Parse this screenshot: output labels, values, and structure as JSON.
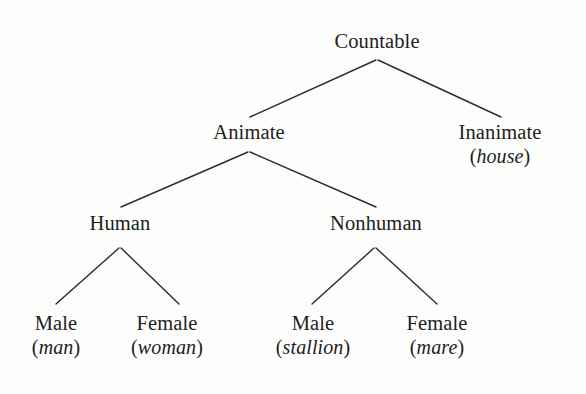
{
  "figure": {
    "kind": "tree-diagram",
    "background_color": "#fdfdfb",
    "line_color": "#2b2b2b",
    "text_color": "#201e1e"
  },
  "nodes": [
    {
      "id": "countable",
      "label": "Countable",
      "example": "",
      "paren_open": "",
      "paren_close": "",
      "x": 377,
      "y": 30,
      "level": 0
    },
    {
      "id": "animate",
      "label": "Animate",
      "example": "",
      "paren_open": "",
      "paren_close": "",
      "x": 249,
      "y": 121,
      "level": 1
    },
    {
      "id": "inanimate",
      "label": "Inanimate",
      "example": "house",
      "paren_open": "(",
      "paren_close": ")",
      "x": 500,
      "y": 121,
      "level": 1
    },
    {
      "id": "human",
      "label": "Human",
      "example": "",
      "paren_open": "",
      "paren_close": "",
      "x": 120,
      "y": 212,
      "level": 2
    },
    {
      "id": "nonhuman",
      "label": "Nonhuman",
      "example": "",
      "paren_open": "",
      "paren_close": "",
      "x": 376,
      "y": 212,
      "level": 2
    },
    {
      "id": "human-male",
      "label": "Male",
      "example": "man",
      "paren_open": "(",
      "paren_close": ")",
      "x": 56,
      "y": 312,
      "level": 3
    },
    {
      "id": "human-female",
      "label": "Female",
      "example": "woman",
      "paren_open": "(",
      "paren_close": ")",
      "x": 167,
      "y": 312,
      "level": 3
    },
    {
      "id": "nonhuman-male",
      "label": "Male",
      "example": "stallion",
      "paren_open": "(",
      "paren_close": ")",
      "x": 313,
      "y": 312,
      "level": 3
    },
    {
      "id": "nonhuman-female",
      "label": "Female",
      "example": "mare",
      "paren_open": "(",
      "paren_close": ")",
      "x": 437,
      "y": 312,
      "level": 3
    }
  ],
  "edges": [
    {
      "id": "countable-animate",
      "from": "countable",
      "to": "animate",
      "x1": 376,
      "y1": 60,
      "x2": 250,
      "y2": 117
    },
    {
      "id": "countable-inanimate",
      "from": "countable",
      "to": "inanimate",
      "x1": 378,
      "y1": 60,
      "x2": 501,
      "y2": 117
    },
    {
      "id": "animate-human",
      "from": "animate",
      "to": "human",
      "x1": 248,
      "y1": 152,
      "x2": 121,
      "y2": 207
    },
    {
      "id": "animate-nonhuman",
      "from": "animate",
      "to": "nonhuman",
      "x1": 250,
      "y1": 152,
      "x2": 376,
      "y2": 207
    },
    {
      "id": "human-male-edge",
      "from": "human",
      "to": "human-male",
      "x1": 119,
      "y1": 248,
      "x2": 56,
      "y2": 304
    },
    {
      "id": "human-female-edge",
      "from": "human",
      "to": "human-female",
      "x1": 121,
      "y1": 248,
      "x2": 179,
      "y2": 304
    },
    {
      "id": "nonhuman-male-edge",
      "from": "nonhuman",
      "to": "nonhuman-male",
      "x1": 374,
      "y1": 248,
      "x2": 312,
      "y2": 304
    },
    {
      "id": "nonhuman-female-edge",
      "from": "nonhuman",
      "to": "nonhuman-female",
      "x1": 376,
      "y1": 248,
      "x2": 437,
      "y2": 304
    }
  ]
}
